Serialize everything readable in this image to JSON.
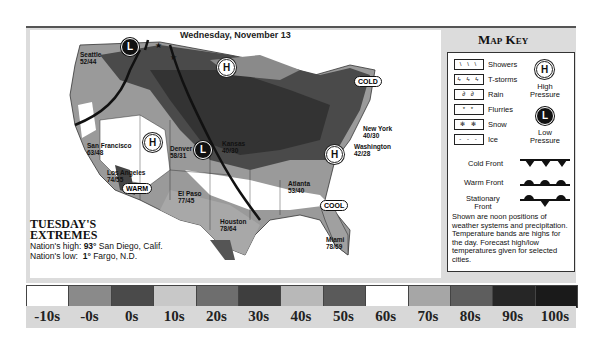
{
  "map": {
    "date": "Wednesday, November 13",
    "cities": [
      {
        "name": "Seattle",
        "temps": "52/44"
      },
      {
        "name": "San Francisco",
        "temps": "63/48"
      },
      {
        "name": "Los Angeles",
        "temps": "74/55"
      },
      {
        "name": "Denver",
        "temps": "58/31"
      },
      {
        "name": "El Paso",
        "temps": "77/45"
      },
      {
        "name": "Kansas",
        "temps": "40/30"
      },
      {
        "name": "Houston",
        "temps": "78/64"
      },
      {
        "name": "Atlanta",
        "temps": "53/40"
      },
      {
        "name": "Miami",
        "temps": "78/69"
      },
      {
        "name": "New York",
        "temps": "40/30"
      },
      {
        "name": "Washington",
        "temps": "42/28"
      },
      {
        "name": "Minneapolis",
        "temps": ""
      },
      {
        "name": "Chicago",
        "temps": ""
      }
    ],
    "badges": {
      "cold": "COLD",
      "warm": "WARM",
      "cool": "COOL"
    },
    "pressure": {
      "high": "H",
      "low": "L"
    }
  },
  "extremes": {
    "title_line1": "TUESDAY'S",
    "title_line2": "EXTREMES",
    "high_label": "Nation's high:",
    "high_value": "93°",
    "high_place": "San Diego, Calif.",
    "low_label": "Nation's low:",
    "low_value": "1°",
    "low_place": "Fargo, N.D."
  },
  "key": {
    "title": "Map Key",
    "precip": [
      {
        "label": "Showers",
        "glyph": "\\ \\ \\"
      },
      {
        "label": "T-storms",
        "glyph": "ϟ ϟ ϟ"
      },
      {
        "label": "Rain",
        "glyph": "∂ ∂"
      },
      {
        "label": "Flurries",
        "glyph": "* *"
      },
      {
        "label": "Snow",
        "glyph": "✻ ✻"
      },
      {
        "label": "Ice",
        "glyph": "- - -"
      }
    ],
    "high_label_1": "High",
    "high_label_2": "Pressure",
    "low_label_1": "Low",
    "low_label_2": "Pressure",
    "cold_front": "Cold Front",
    "warm_front": "Warm Front",
    "stationary_1": "Stationary",
    "stationary_2": "Front",
    "note": "Shown are noon positions of weather systems and precipitation. Temperature bands are highs for the day. Forecast high/low temperatures given for selected cities."
  },
  "scale": {
    "bands": [
      {
        "label": "-10s",
        "color": "#ffffff"
      },
      {
        "label": "-0s",
        "color": "#8a8a8a"
      },
      {
        "label": "0s",
        "color": "#4a4a4a"
      },
      {
        "label": "10s",
        "color": "#c8c8c8"
      },
      {
        "label": "20s",
        "color": "#6e6e6e"
      },
      {
        "label": "30s",
        "color": "#3e3e3e"
      },
      {
        "label": "40s",
        "color": "#b8b8b8"
      },
      {
        "label": "50s",
        "color": "#5a5a5a"
      },
      {
        "label": "60s",
        "color": "#ffffff"
      },
      {
        "label": "70s",
        "color": "#a6a6a6"
      },
      {
        "label": "80s",
        "color": "#5e5e5e"
      },
      {
        "label": "90s",
        "color": "#262626"
      },
      {
        "label": "100s",
        "color": "#1a1a1a"
      }
    ]
  }
}
